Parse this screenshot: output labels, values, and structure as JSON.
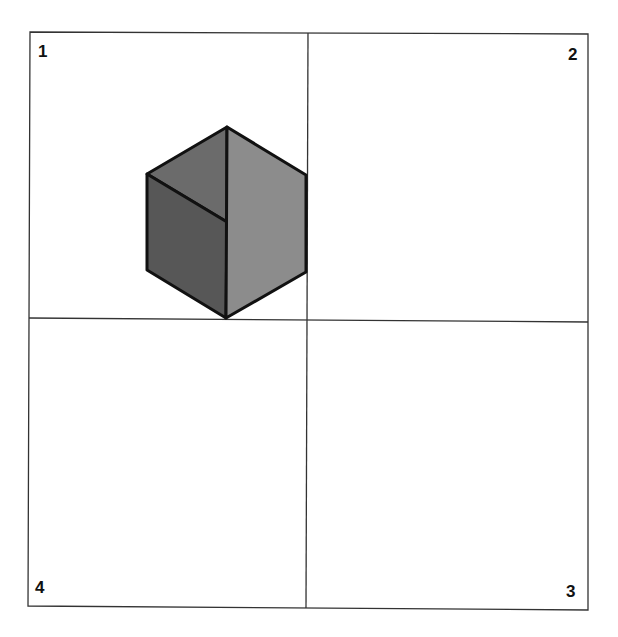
{
  "diagram": {
    "quadrant_labels": {
      "q1": "1",
      "q2": "2",
      "q3": "3",
      "q4": "4"
    },
    "shape": {
      "type": "isometric-cube-hexagon",
      "position_quadrant": "1",
      "colors": {
        "top_face": "#6b6b6b",
        "left_face": "#575757",
        "right_face": "#8c8c8c",
        "outline": "#111111"
      }
    },
    "grid_color": "#333333"
  }
}
